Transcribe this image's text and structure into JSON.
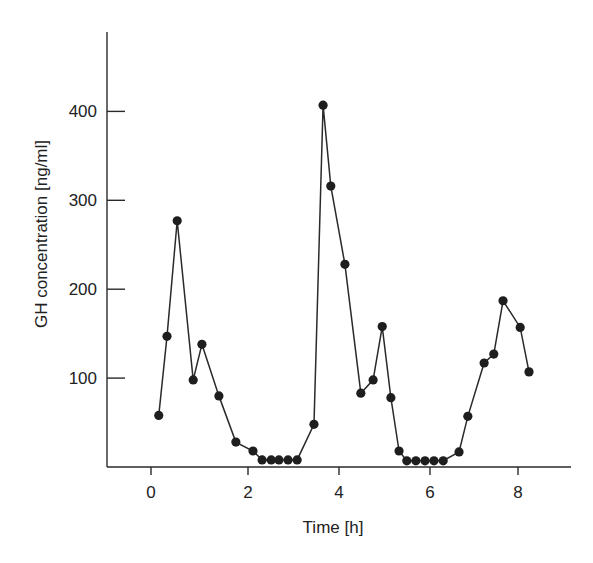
{
  "chart_data": {
    "type": "line",
    "title": "",
    "xlabel": "Time [h]",
    "ylabel": "GH concentration [ng/ml]",
    "xlim": [
      -0.9,
      9.2
    ],
    "ylim": [
      0,
      460
    ],
    "x_ticks": [
      0,
      2,
      4,
      6,
      8
    ],
    "x_tick_labels": [
      "0",
      "2",
      "4",
      "6",
      "8"
    ],
    "y_ticks": [
      100,
      200,
      300,
      400
    ],
    "y_tick_labels": [
      "100",
      "200",
      "300",
      "400"
    ],
    "grid": false,
    "legend": null,
    "series": [
      {
        "name": "GH concentration",
        "markers": true,
        "x": [
          0.16,
          0.33,
          0.54,
          0.87,
          1.05,
          1.4,
          1.75,
          2.11,
          2.31,
          2.51,
          2.68,
          2.88,
          3.08,
          3.45,
          3.65,
          3.82,
          4.13,
          4.48,
          4.75,
          4.95,
          5.14,
          5.32,
          5.49,
          5.69,
          5.89,
          6.09,
          6.3,
          6.66,
          6.86,
          7.23,
          7.45,
          7.66,
          8.05,
          8.25
        ],
        "y": [
          58,
          147,
          277,
          98,
          138,
          80,
          28,
          18,
          8,
          8,
          8,
          8,
          8,
          48,
          407,
          316,
          228,
          83,
          98,
          158,
          78,
          18,
          7,
          7,
          7,
          7,
          7,
          17,
          57,
          117,
          127,
          187,
          157,
          107
        ]
      }
    ]
  }
}
